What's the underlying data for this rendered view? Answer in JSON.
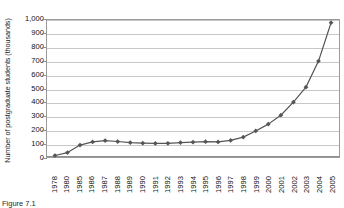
{
  "chart_data": {
    "type": "line",
    "title": "",
    "xlabel": "",
    "ylabel": "Number of postgraduate students (thousands)",
    "ylim": [
      0,
      1000
    ],
    "ytick_step": 100,
    "ytick_labels": [
      "1,000",
      "900",
      "800",
      "700",
      "600",
      "500",
      "400",
      "300",
      "200",
      "100",
      "0"
    ],
    "grid": "horizontal",
    "legend": "none",
    "marker": "diamond",
    "series_color": "#555555",
    "gridline_color": "#c8c8c8",
    "axis_color": "#8f8f8f",
    "categories": [
      "1978",
      "1980",
      "1985",
      "1986",
      "1987",
      "1988",
      "1989",
      "1990",
      "1991",
      "1992",
      "1993",
      "1994",
      "1995",
      "1996",
      "1997",
      "1998",
      "1999",
      "2000",
      "2001",
      "2002",
      "2003",
      "2004",
      "2005"
    ],
    "values": [
      11,
      32,
      87,
      110,
      120,
      113,
      105,
      101,
      99,
      100,
      105,
      108,
      112,
      110,
      121,
      145,
      190,
      240,
      305,
      400,
      510,
      700,
      980
    ]
  },
  "caption": {
    "text": "Figure 7.1"
  }
}
